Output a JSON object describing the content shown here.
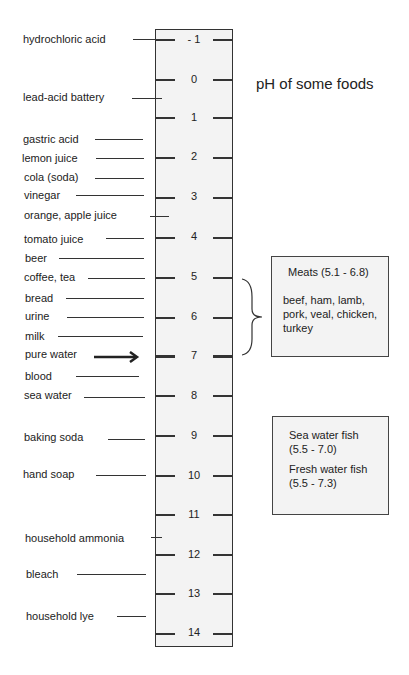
{
  "title": "pH of some foods",
  "scale": {
    "ticks": [
      "- 1",
      "0",
      "1",
      "2",
      "3",
      "4",
      "5",
      "6",
      "7",
      "8",
      "9",
      "10",
      "11",
      "12",
      "13",
      "14"
    ]
  },
  "substances": [
    {
      "name": "hydrochloric acid",
      "ph": -1
    },
    {
      "name": "lead-acid battery",
      "ph": 0.5
    },
    {
      "name": "gastric acid",
      "ph": 1.5
    },
    {
      "name": "lemon juice",
      "ph": 2
    },
    {
      "name": "cola (soda)",
      "ph": 2.5
    },
    {
      "name": "vinegar",
      "ph": 3
    },
    {
      "name": "orange, apple juice",
      "ph": 3.5
    },
    {
      "name": "tomato juice",
      "ph": 4
    },
    {
      "name": "beer",
      "ph": 4.5
    },
    {
      "name": "coffee, tea",
      "ph": 5
    },
    {
      "name": "bread",
      "ph": 5.5
    },
    {
      "name": "urine",
      "ph": 6
    },
    {
      "name": "milk",
      "ph": 6.5
    },
    {
      "name": "pure water",
      "ph": 7
    },
    {
      "name": "blood",
      "ph": 7.4
    },
    {
      "name": "sea water",
      "ph": 8
    },
    {
      "name": "baking soda",
      "ph": 9
    },
    {
      "name": "hand soap",
      "ph": 10
    },
    {
      "name": "household ammonia",
      "ph": 11.5
    },
    {
      "name": "bleach",
      "ph": 12.5
    },
    {
      "name": "household lye",
      "ph": 13.5
    }
  ],
  "meats_box": {
    "heading": "Meats (5.1 - 6.8)",
    "line1": "beef, ham, lamb,",
    "line2": "pork, veal, chicken,",
    "line3": "turkey"
  },
  "fish_box": {
    "sea_label": "Sea water fish",
    "sea_range": "(5.5 - 7.0)",
    "fresh_label": "Fresh water fish",
    "fresh_range": "(5.5 - 7.3)"
  }
}
